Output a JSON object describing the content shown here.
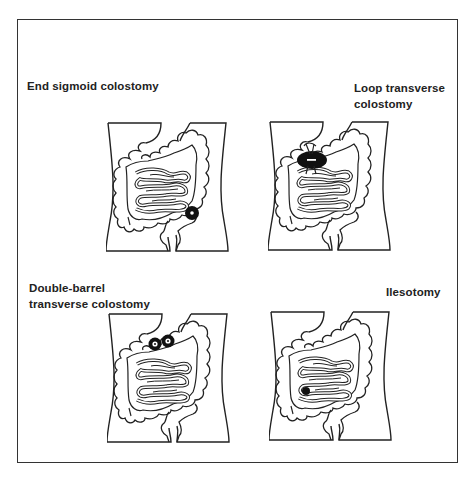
{
  "figure": {
    "panels": [
      {
        "id": "end-sigmoid",
        "label_lines": [
          "End sigmoid colostomy"
        ],
        "stoma": {
          "type": "end",
          "location": "left lower quadrant (sigmoid colon)"
        }
      },
      {
        "id": "loop-transverse",
        "label_lines": [
          "Loop transverse",
          "colostomy"
        ],
        "stoma": {
          "type": "loop",
          "location": "transverse colon, upper abdomen, with supporting rod"
        }
      },
      {
        "id": "double-barrel-transverse",
        "label_lines": [
          "Double-barrel",
          "transverse colostomy"
        ],
        "stoma": {
          "type": "double-barrel",
          "location": "transverse colon, two adjacent stomas"
        }
      },
      {
        "id": "ileostomy",
        "label_lines": [
          "Ilesotomy"
        ],
        "stoma": {
          "type": "ileostomy",
          "location": "terminal ileum, right lower quadrant"
        }
      }
    ]
  },
  "colors": {
    "line": "#222222",
    "stoma": "#111111",
    "background": "#ffffff",
    "frame": "#333333"
  }
}
